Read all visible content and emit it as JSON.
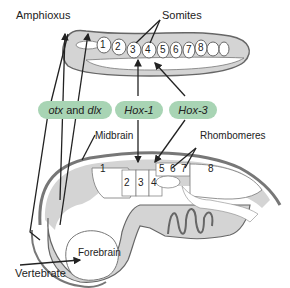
{
  "labels": {
    "amphioxus": "Amphioxus",
    "somites": "Somites",
    "midbrain": "Midbrain",
    "rhombomeres": "Rhombomeres",
    "forebrain": "Forebrain",
    "vertebrate": "Vertebrate"
  },
  "genes": {
    "otx": "otx",
    "and": " and ",
    "dlx": "dlx",
    "hox1": "Hox-1",
    "hox3": "Hox-3"
  },
  "somite_numbers": [
    "1",
    "2",
    "3",
    "4",
    "5",
    "6",
    "7",
    "8"
  ],
  "rhombomere_numbers": [
    "1",
    "2",
    "3",
    "4",
    "5",
    "6",
    "7",
    "8"
  ],
  "colors": {
    "body_fill": "#d4d4d4",
    "outline": "#666666",
    "gene_pill": "#a8d4b4",
    "arrow": "#222222"
  }
}
